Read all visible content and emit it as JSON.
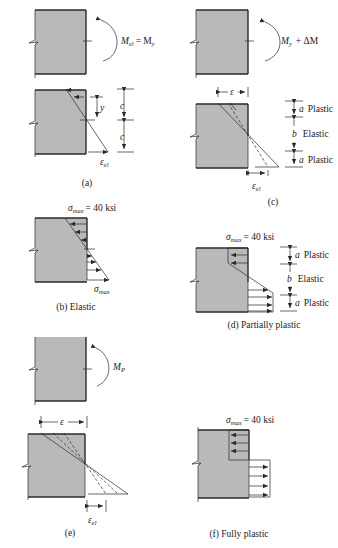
{
  "figure": {
    "panels": [
      {
        "id": "a",
        "moment_label": "M",
        "moment_sub": "el",
        "moment_eq": "= M",
        "moment_eq_sub": "y",
        "dimension_labels": {
          "y": "y",
          "c_top": "c",
          "c_bottom": "c",
          "strain": "ε",
          "strain_sub": "el"
        },
        "caption": "(a)"
      },
      {
        "id": "b",
        "stress_label": "σ",
        "stress_sub": "max",
        "stress_value": "= 40 ksi",
        "bottom_stress_label": "σ",
        "bottom_stress_sub": "max",
        "caption": "(b)  Elastic"
      },
      {
        "id": "c",
        "moment_label": "M",
        "moment_sub": "y",
        "moment_extra": "+ ΔM",
        "strain_top": "ε",
        "strain_bottom": "ε",
        "strain_bottom_sub": "el",
        "zones": [
          {
            "symbol": "a",
            "name": "Plastic"
          },
          {
            "symbol": "b",
            "name": "Elastic"
          },
          {
            "symbol": "a",
            "name": "Plastic"
          }
        ],
        "caption": "(c)"
      },
      {
        "id": "d",
        "stress_label": "σ",
        "stress_sub": "max",
        "stress_value": "= 40 ksi",
        "zones": [
          {
            "symbol": "a",
            "name": "Plastic"
          },
          {
            "symbol": "b",
            "name": "Elastic"
          },
          {
            "symbol": "a",
            "name": "Plastic"
          }
        ],
        "caption": "(d)  Partially plastic"
      },
      {
        "id": "e",
        "moment_label": "M",
        "moment_sub": "P",
        "strain_top": "ε",
        "strain_bottom": "ε",
        "strain_bottom_sub": "el",
        "caption": "(e)"
      },
      {
        "id": "f",
        "stress_label": "σ",
        "stress_sub": "max",
        "stress_value": "= 40 ksi",
        "caption": "(f)  Fully plastic"
      }
    ],
    "colors": {
      "beam_fill": "#b9b9b9",
      "line": "#2a2a2a",
      "background": "#ffffff"
    }
  }
}
